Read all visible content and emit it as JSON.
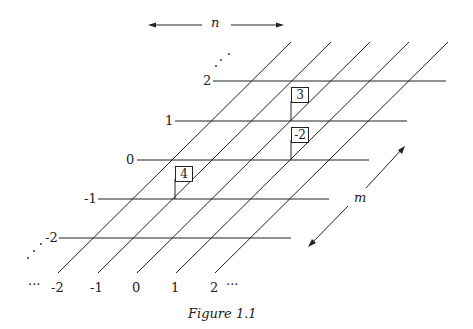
{
  "figure": {
    "caption": "Figure 1.1",
    "top_axis_label": "n",
    "side_axis_label": "m",
    "row_labels": [
      "2",
      "1",
      "0",
      "-1",
      "-2"
    ],
    "column_labels": [
      "-2",
      "-1",
      "0",
      "1",
      "2"
    ],
    "ellipsis": "···",
    "boxes": [
      {
        "value": "3",
        "row": "1",
        "col": "1"
      },
      {
        "value": "-2",
        "row": "0",
        "col": "1"
      },
      {
        "value": "4",
        "row": "-1",
        "col": "0"
      }
    ],
    "colors": {
      "line": "#222222",
      "background": "#ffffff"
    }
  }
}
